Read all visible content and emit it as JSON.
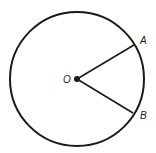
{
  "diagram": {
    "type": "circle-geometry",
    "stroke_color": "#1a1a1a",
    "background": "#ffffff",
    "circle": {
      "center": [
        77,
        79
      ],
      "radius": 67
    },
    "points": [
      {
        "name": "O",
        "label": "O",
        "x": 77,
        "y": 79,
        "role": "center"
      },
      {
        "name": "A",
        "label": "A",
        "x": 134,
        "y": 45,
        "role": "on-circle"
      },
      {
        "name": "B",
        "label": "B",
        "x": 133,
        "y": 113,
        "role": "on-circle"
      }
    ],
    "segments": [
      {
        "from": "O",
        "to": "A"
      },
      {
        "from": "O",
        "to": "B"
      }
    ],
    "labels": {
      "center": "O",
      "point_a": "A",
      "point_b": "B"
    }
  }
}
